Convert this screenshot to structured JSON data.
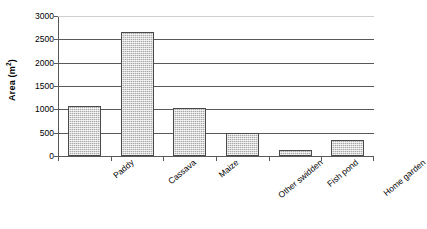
{
  "chart_data": {
    "type": "bar",
    "title": "",
    "subtitle": "",
    "xlabel": "",
    "ylabel": "Area (m2)",
    "ylabel_base": "Area (m",
    "ylabel_sup": "2",
    "ylabel_close": ")",
    "categories": [
      "Paddy",
      "Cassava",
      "Maize",
      "Other swidden",
      "Fish pond",
      "Home garden"
    ],
    "values": [
      1080,
      2650,
      1030,
      490,
      120,
      340
    ],
    "series": [
      {
        "name": "Area",
        "values": [
          1080,
          2650,
          1030,
          490,
          120,
          340
        ]
      }
    ],
    "ylim": [
      0,
      3000
    ],
    "ytick_values": [
      0,
      500,
      1000,
      1500,
      2000,
      2500,
      3000
    ],
    "ytick_labels": [
      "0",
      "500",
      "1000",
      "1500",
      "2000",
      "2500",
      "3000"
    ],
    "grid": "horizontal",
    "legend": "none",
    "legend_position": "none",
    "bar_fill_color": "#a9a9a9",
    "bar_border_color": "#4a4a4a",
    "axis_color": "#595959",
    "gridline_color": "#595959",
    "top_gridline_color": "#cfcfcf",
    "background_color": "#ffffff",
    "x_label_rotation_deg": -40
  }
}
